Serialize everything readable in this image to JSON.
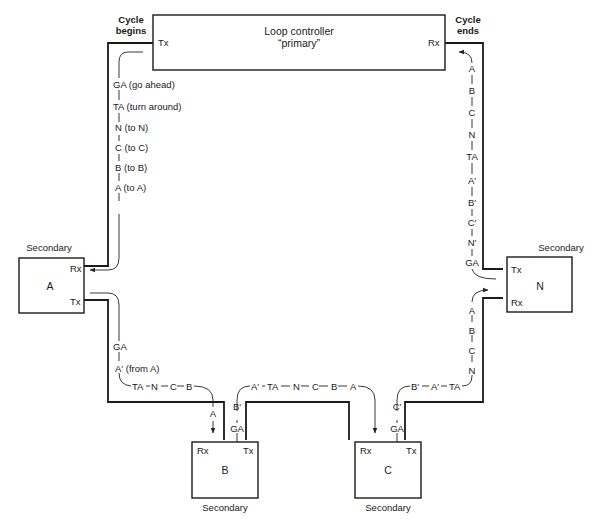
{
  "primary": {
    "title": "Loop controller",
    "subtitle": "“primary”",
    "tx": "Tx",
    "rx": "Rx",
    "cycle_begins": [
      "Cycle",
      "begins"
    ],
    "cycle_ends": [
      "Cycle",
      "ends"
    ]
  },
  "secondaries": {
    "a": {
      "heading": "Secondary",
      "name": "A",
      "rx": "Rx",
      "tx": "Tx"
    },
    "b": {
      "heading": "Secondary",
      "name": "B",
      "rx": "Rx",
      "tx": "Tx"
    },
    "c": {
      "heading": "Secondary",
      "name": "C",
      "rx": "Rx",
      "tx": "Tx"
    },
    "n": {
      "heading": "Secondary",
      "name": "N",
      "rx": "Rx",
      "tx": "Tx"
    }
  },
  "flows": {
    "primary_to_a": [
      "GA (go ahead)",
      "TA (turn around)",
      "N (to N)",
      "C (to C)",
      "B (to B)",
      "A (to A)"
    ],
    "a_to_b": {
      "vertical": [
        "GA",
        "A′ (from A)"
      ],
      "horizontal": [
        "TA",
        "N",
        "C",
        "B"
      ],
      "drop": "A"
    },
    "b_out": {
      "vertical": [
        "B′",
        "GA"
      ],
      "horizontal": [
        "A′",
        "TA",
        "N",
        "C",
        "B",
        "A"
      ]
    },
    "c_out": {
      "vertical": [
        "C′",
        "GA"
      ],
      "horizontal": [
        "B′",
        "A′",
        "TA"
      ]
    },
    "to_n": [
      "N",
      "C",
      "B",
      "A"
    ],
    "n_to_primary": [
      "GA",
      "N′",
      "C′",
      "B′",
      "A′",
      "TA",
      "N",
      "C",
      "B",
      "A"
    ]
  }
}
